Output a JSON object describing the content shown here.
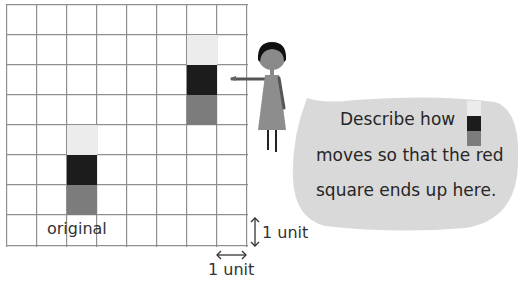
{
  "grid": {
    "columns": 8,
    "rows": 8,
    "cell_size_px": 30,
    "line_color": "#8f8f8f"
  },
  "colors": {
    "light": "#ececec",
    "dark": "#1c1c1c",
    "red": "#7c7c7c",
    "bubble": "#d9d9d9"
  },
  "shapes": {
    "original": {
      "column": 2,
      "top_row": 4,
      "label": "original"
    },
    "moved": {
      "column": 6,
      "top_row": 1
    }
  },
  "units": {
    "vertical_label": "1 unit",
    "horizontal_label": "1 unit"
  },
  "speech_bubble": {
    "line1": "Describe how",
    "line2": "moves so that the red",
    "line3": "square ends up here."
  }
}
